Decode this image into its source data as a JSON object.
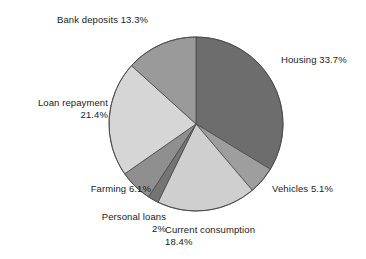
{
  "chart_data": {
    "type": "pie",
    "title": "",
    "subtitle": "",
    "xlabel": "",
    "ylabel": "",
    "legend_position": "none",
    "grid": false,
    "labels_outside": true,
    "start_angle_deg": 0,
    "direction": "clockwise",
    "categories": [
      "Housing",
      "Vehicles",
      "Current consumption",
      "Personal loans",
      "Farming",
      "Loan repayment",
      "Bank deposits"
    ],
    "values": [
      33.7,
      5.1,
      18.4,
      2,
      6.1,
      21.4,
      13.3
    ],
    "units": "percent",
    "slices": [
      {
        "name": "Housing",
        "value": 33.7,
        "value_text": "33.7%",
        "color": "#6d6d6d"
      },
      {
        "name": "Vehicles",
        "value": 5.1,
        "value_text": "5.1%",
        "color": "#9e9e9e"
      },
      {
        "name": "Current consumption",
        "value": 18.4,
        "value_text": "18.4%",
        "color": "#cfcfcf"
      },
      {
        "name": "Personal loans",
        "value": 2,
        "value_text": "2%",
        "color": "#757575"
      },
      {
        "name": "Farming",
        "value": 6.1,
        "value_text": "6.1%",
        "color": "#8f8f8f"
      },
      {
        "name": "Loan repayment",
        "value": 21.4,
        "value_text": "21.4%",
        "color": "#d6d6d6"
      },
      {
        "name": "Bank deposits",
        "value": 13.3,
        "value_text": "13.3%",
        "color": "#9a9a9a"
      }
    ]
  },
  "labels": {
    "housing": "Housing 33.7%",
    "vehicles": "Vehicles  5.1%",
    "current_consumption_line1": "Current consumption",
    "current_consumption_line2": "18.4%",
    "personal_loans_line1": "Personal loans",
    "personal_loans_line2": "2%",
    "farming": "Farming 6.1%",
    "loan_repayment_line1": "Loan repayment",
    "loan_repayment_line2": "21.4%",
    "bank_deposits": "Bank deposits 13.3%"
  },
  "colors": {
    "background": "#ffffff",
    "outline": "#4a4a4a",
    "text": "#1a1a1a"
  }
}
